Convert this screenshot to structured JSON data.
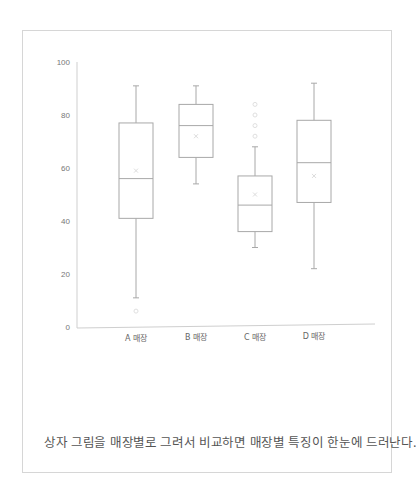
{
  "caption": "상자 그림을 매장별로 그려서 비교하면 매장별 특징이 한눈에 드러난다.",
  "colors": {
    "box": "#a8a8a8",
    "axis": "#cfcfcf",
    "outlier": "#e0e0e0",
    "mean": "#dcdcdc",
    "frame": "#d6d6d6"
  },
  "chart_data": {
    "type": "box",
    "title": "",
    "xlabel": "",
    "ylabel": "",
    "ylim": [
      0,
      100
    ],
    "yticks": [
      0,
      20,
      40,
      60,
      80,
      100
    ],
    "grid": false,
    "legend": null,
    "categories": [
      "A 매장",
      "B 매장",
      "C 매장",
      "D 매장"
    ],
    "series": [
      {
        "name": "A 매장",
        "whisker_low": 11,
        "q1": 41,
        "median": 56,
        "q3": 77,
        "whisker_high": 91,
        "mean": 59,
        "outliers": [
          6
        ]
      },
      {
        "name": "B 매장",
        "whisker_low": 54,
        "q1": 64,
        "median": 76,
        "q3": 84,
        "whisker_high": 91,
        "mean": 72,
        "outliers": []
      },
      {
        "name": "C 매장",
        "whisker_low": 30,
        "q1": 36,
        "median": 46,
        "q3": 57,
        "whisker_high": 68,
        "mean": 50,
        "outliers": [
          72,
          76,
          80,
          84
        ]
      },
      {
        "name": "D 매장",
        "whisker_low": 22,
        "q1": 47,
        "median": 62,
        "q3": 78,
        "whisker_high": 92,
        "mean": 57,
        "outliers": []
      }
    ]
  }
}
